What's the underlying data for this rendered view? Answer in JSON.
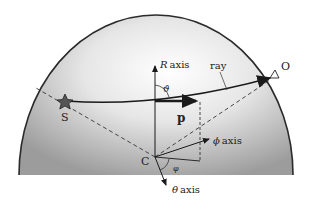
{
  "diagram": {
    "labels": {
      "r_axis_symbol": "R",
      "r_axis_word": "axis",
      "ray": "ray",
      "observer": "O",
      "source": "S",
      "center": "C",
      "momentum": "p",
      "theta_angle": "ϑ",
      "phi_axis_symbol": "ϕ",
      "phi_axis_word": "axis",
      "phi_angle": "φ",
      "theta_axis_symbol": "θ",
      "theta_axis_word": "axis"
    },
    "colors": {
      "dome_edge": "#2a2a2a",
      "dome_light": "#ffffff",
      "dome_dark": "#9a9a9a",
      "lines": "#1a1a1a"
    }
  }
}
